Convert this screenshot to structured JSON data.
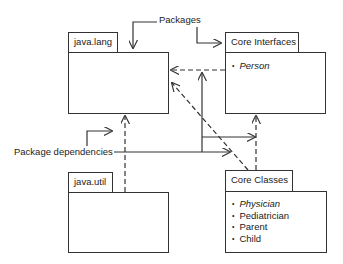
{
  "labels": {
    "packages": "Packages",
    "package_dependencies": "Package dependencies"
  },
  "packages": {
    "java_lang": {
      "name": "java.lang",
      "items": []
    },
    "core_interfaces": {
      "name": "Core Interfaces",
      "items": [
        {
          "label": "Person",
          "italic": true
        }
      ]
    },
    "java_util": {
      "name": "java.util",
      "items": []
    },
    "core_classes": {
      "name": "Core Classes",
      "items": [
        {
          "label": "Physician",
          "italic": true
        },
        {
          "label": "Pediatrician",
          "italic": false
        },
        {
          "label": "Parent",
          "italic": false
        },
        {
          "label": "Child",
          "italic": false
        }
      ]
    }
  },
  "dependencies": [
    {
      "from": "Core Interfaces",
      "to": "java.lang",
      "style": "dashed"
    },
    {
      "from": "Core Classes",
      "to": "java.lang",
      "style": "dashed"
    },
    {
      "from": "java.util",
      "to": "java.lang",
      "style": "dashed"
    },
    {
      "from": "Core Classes",
      "to": "Core Interfaces",
      "style": "dashed"
    }
  ],
  "colors": {
    "line": "#333333",
    "background": "#ffffff",
    "text": "#222222"
  }
}
